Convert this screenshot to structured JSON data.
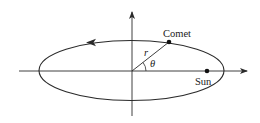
{
  "diagram": {
    "labels": {
      "comet": "Comet",
      "sun": "Sun",
      "radius": "r",
      "angle": "θ"
    },
    "colors": {
      "stroke": "#2a2a2a",
      "background": "#ffffff"
    }
  }
}
